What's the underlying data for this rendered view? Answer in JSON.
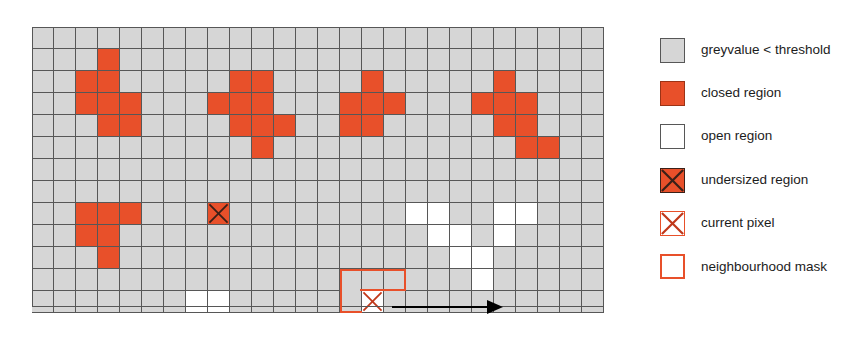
{
  "figure": {
    "colors": {
      "background_grey": "#d6d6d6",
      "closed_red": "#e8502a",
      "open_white": "#ffffff",
      "gridline": "#575757",
      "mask_outline": "#e8502a",
      "undersized_x": "#3a2018",
      "arrow": "#000000"
    }
  },
  "grid": {
    "columns": 26,
    "rows": 13,
    "cell_size_px": 22,
    "default_state": "greyvalue < threshold",
    "closed_cells": [
      [
        1,
        3
      ],
      [
        2,
        2
      ],
      [
        2,
        3
      ],
      [
        3,
        2
      ],
      [
        3,
        3
      ],
      [
        3,
        4
      ],
      [
        4,
        3
      ],
      [
        4,
        4
      ],
      [
        2,
        9
      ],
      [
        2,
        10
      ],
      [
        3,
        8
      ],
      [
        3,
        9
      ],
      [
        3,
        10
      ],
      [
        4,
        9
      ],
      [
        4,
        10
      ],
      [
        4,
        11
      ],
      [
        5,
        10
      ],
      [
        2,
        15
      ],
      [
        3,
        14
      ],
      [
        3,
        15
      ],
      [
        3,
        16
      ],
      [
        4,
        14
      ],
      [
        4,
        15
      ],
      [
        2,
        21
      ],
      [
        3,
        20
      ],
      [
        3,
        21
      ],
      [
        3,
        22
      ],
      [
        4,
        21
      ],
      [
        4,
        22
      ],
      [
        5,
        22
      ],
      [
        5,
        23
      ],
      [
        8,
        2
      ],
      [
        8,
        3
      ],
      [
        8,
        4
      ],
      [
        9,
        2
      ],
      [
        9,
        3
      ],
      [
        10,
        3
      ]
    ],
    "open_cells": [
      [
        8,
        17
      ],
      [
        8,
        18
      ],
      [
        8,
        21
      ],
      [
        8,
        22
      ],
      [
        9,
        18
      ],
      [
        9,
        19
      ],
      [
        9,
        21
      ],
      [
        10,
        19
      ],
      [
        10,
        20
      ],
      [
        11,
        20
      ],
      [
        12,
        7
      ],
      [
        12,
        8
      ]
    ],
    "undersized_cells": [
      [
        8,
        8
      ]
    ],
    "current_pixel": [
      12,
      15
    ],
    "neighbourhood_mask": {
      "row": 11,
      "col_start": 14,
      "col_end": 16,
      "tail_row": 12,
      "tail_col": 14
    },
    "arrow": {
      "from_col": 16.2,
      "to_col": 20.4,
      "row": 12,
      "direction": "right"
    }
  },
  "legend": {
    "items": [
      {
        "icon": "grey-swatch-icon",
        "style": "grey",
        "label": "greyvalue < threshold"
      },
      {
        "icon": "red-swatch-icon",
        "style": "closed",
        "label": "closed region"
      },
      {
        "icon": "white-swatch-icon",
        "style": "open",
        "label": "open region"
      },
      {
        "icon": "crossed-red-swatch-icon",
        "style": "under",
        "label": "undersized region"
      },
      {
        "icon": "crossed-white-swatch-icon",
        "style": "current",
        "label": "current pixel"
      },
      {
        "icon": "outlined-swatch-icon",
        "style": "mask",
        "label": "neighbourhood mask"
      }
    ]
  }
}
